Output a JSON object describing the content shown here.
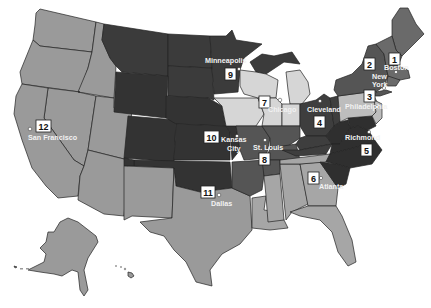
{
  "map": {
    "title": "Federal Reserve Districts",
    "colors": {
      "dark": "#3b3b3b",
      "darker": "#2f2f2f",
      "medium_dark": "#555555",
      "medium": "#6a6a6a",
      "light": "#9a9a9a",
      "lighter": "#bdbdbd",
      "lightest": "#d6d6d6",
      "background": "#ffffff"
    },
    "districts": [
      {
        "number": "1",
        "city": "Boston"
      },
      {
        "number": "2",
        "city": "New York"
      },
      {
        "number": "3",
        "city": "Philadelphia"
      },
      {
        "number": "4",
        "city": "Cleveland"
      },
      {
        "number": "5",
        "city": "Richmond"
      },
      {
        "number": "6",
        "city": "Atlanta"
      },
      {
        "number": "7",
        "city": "Chicago"
      },
      {
        "number": "8",
        "city": "St. Louis"
      },
      {
        "number": "9",
        "city": "Minneapolis"
      },
      {
        "number": "10",
        "city": "Kansas City"
      },
      {
        "number": "11",
        "city": "Dallas"
      },
      {
        "number": "12",
        "city": "San Francisco"
      }
    ],
    "labels": {
      "boston": "Boston",
      "new_york_1": "New",
      "new_york_2": "York",
      "philadelphia": "Philadelphia",
      "cleveland": "Cleveland",
      "richmond": "Richmond",
      "atlanta": "Atlanta",
      "chicago": "Chicago",
      "st_louis": "St. Louis",
      "minneapolis": "Minneapolis",
      "kansas_city_1": "Kansas",
      "kansas_city_2": "City",
      "dallas": "Dallas",
      "san_francisco": "San Francisco"
    },
    "insets": [
      "Alaska",
      "Hawaii"
    ]
  }
}
